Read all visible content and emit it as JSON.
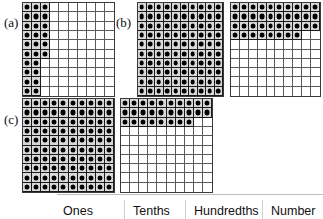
{
  "figure": {
    "parts": [
      {
        "id": "a",
        "label": "(a)",
        "grids": [
          {
            "name": "grid-a-1",
            "rows": 10,
            "cols": 10,
            "filled_per_row": [
              3,
              3,
              3,
              3,
              3,
              3,
              2,
              2,
              2,
              2
            ],
            "filled_total": 26
          }
        ]
      },
      {
        "id": "b",
        "label": "(b)",
        "grids": [
          {
            "name": "grid-b-1",
            "rows": 10,
            "cols": 10,
            "filled_per_row": [
              10,
              10,
              10,
              10,
              10,
              10,
              10,
              10,
              10,
              10
            ],
            "filled_total": 100
          },
          {
            "name": "grid-b-2",
            "rows": 10,
            "cols": 10,
            "filled_per_row": [
              10,
              10,
              10,
              8,
              0,
              0,
              0,
              0,
              0,
              0
            ],
            "filled_total": 38
          }
        ]
      },
      {
        "id": "c",
        "label": "(c)",
        "grids": [
          {
            "name": "grid-c-1",
            "rows": 10,
            "cols": 10,
            "filled_per_row": [
              10,
              10,
              10,
              10,
              10,
              10,
              10,
              10,
              10,
              10
            ],
            "filled_total": 100
          },
          {
            "name": "grid-c-2",
            "rows": 10,
            "cols": 10,
            "filled_per_row": [
              10,
              10,
              8,
              0,
              0,
              0,
              0,
              0,
              0,
              0
            ],
            "filled_total": 28
          }
        ]
      }
    ]
  },
  "table": {
    "headers": [
      "Ones",
      "Tenths",
      "Hundredths",
      "Number"
    ]
  },
  "colors": {
    "filled_dot": "#000000",
    "filled_cell_bg": "#d9d9d9",
    "grid_line": "#5a5a5a",
    "grid_border": "#3a3a3a",
    "text": "#111111",
    "rule": "#bdbdbd"
  }
}
